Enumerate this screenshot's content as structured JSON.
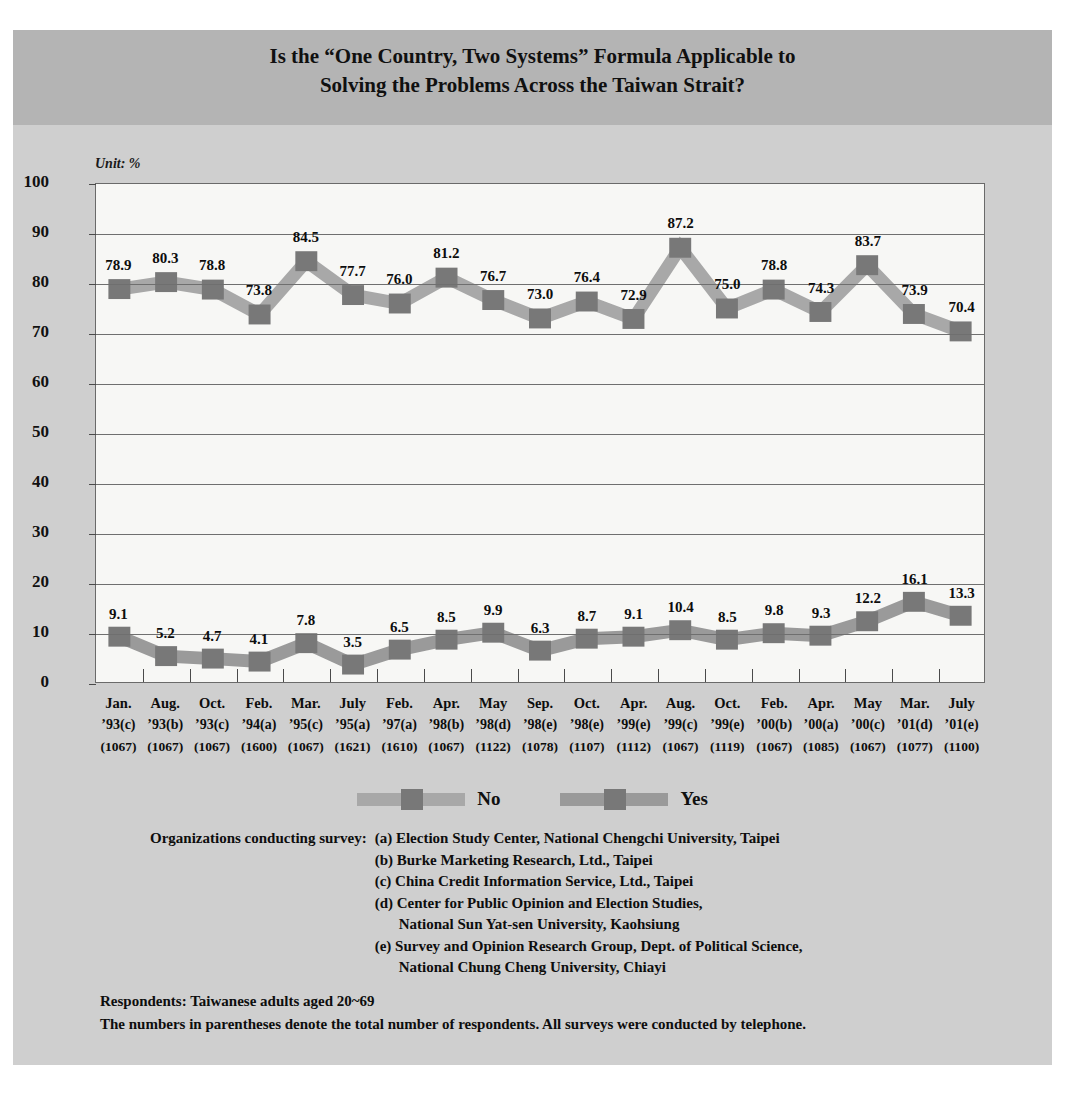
{
  "title": {
    "line1": "Is the “One Country, Two Systems” Formula Applicable to",
    "line2": "Solving the Problems Across the Taiwan Strait?"
  },
  "unit_label": "Unit: %",
  "legend": {
    "no_label": "No",
    "yes_label": "Yes",
    "no_color": "#a8a8a8",
    "yes_color": "#9a9a9a",
    "marker_color": "#787878"
  },
  "notes": {
    "org_heading": "Organizations conducting survey:",
    "orgs": [
      "(a) Election Study Center, National Chengchi University, Taipei",
      "(b) Burke Marketing Research, Ltd., Taipei",
      "(c) China Credit Information Service, Ltd., Taipei",
      "(d) Center for Public Opinion and Election Studies,",
      "National Sun Yat-sen University, Kaohsiung",
      "(e) Survey and Opinion Research Group, Dept. of Political Science,",
      "National Chung Cheng University, Chiayi"
    ],
    "respondents": "Respondents: Taiwanese adults aged 20~69",
    "parenthesis_note": "The numbers in parentheses denote the total number of respondents. All surveys were conducted by telephone."
  },
  "chart_data": {
    "type": "line",
    "title": "Is the “One Country, Two Systems” Formula Applicable to Solving the Problems Across the Taiwan Strait?",
    "xlabel": "",
    "ylabel": "",
    "unit": "%",
    "ylim": [
      0,
      100
    ],
    "yticks": [
      0,
      10,
      20,
      30,
      40,
      50,
      60,
      70,
      80,
      90,
      100
    ],
    "grid": true,
    "legend_position": "bottom",
    "categories": [
      {
        "month": "Jan.",
        "year": "’93(c)",
        "n": "(1067)"
      },
      {
        "month": "Aug.",
        "year": "’93(b)",
        "n": "(1067)"
      },
      {
        "month": "Oct.",
        "year": "’93(c)",
        "n": "(1067)"
      },
      {
        "month": "Feb.",
        "year": "’94(a)",
        "n": "(1600)"
      },
      {
        "month": "Mar.",
        "year": "’95(c)",
        "n": "(1067)"
      },
      {
        "month": "July",
        "year": "’95(a)",
        "n": "(1621)"
      },
      {
        "month": "Feb.",
        "year": "’97(a)",
        "n": "(1610)"
      },
      {
        "month": "Apr.",
        "year": "’98(b)",
        "n": "(1067)"
      },
      {
        "month": "May",
        "year": "’98(d)",
        "n": "(1122)"
      },
      {
        "month": "Sep.",
        "year": "’98(e)",
        "n": "(1078)"
      },
      {
        "month": "Oct.",
        "year": "’98(e)",
        "n": "(1107)"
      },
      {
        "month": "Apr.",
        "year": "’99(e)",
        "n": "(1112)"
      },
      {
        "month": "Aug.",
        "year": "’99(c)",
        "n": "(1067)"
      },
      {
        "month": "Oct.",
        "year": "’99(e)",
        "n": "(1119)"
      },
      {
        "month": "Feb.",
        "year": "’00(b)",
        "n": "(1067)"
      },
      {
        "month": "Apr.",
        "year": "’00(a)",
        "n": "(1085)"
      },
      {
        "month": "May",
        "year": "’00(c)",
        "n": "(1067)"
      },
      {
        "month": "Mar.",
        "year": "’01(d)",
        "n": "(1077)"
      },
      {
        "month": "July",
        "year": "’01(e)",
        "n": "(1100)"
      }
    ],
    "series": [
      {
        "name": "No",
        "color": "#a8a8a8",
        "values": [
          78.9,
          80.3,
          78.8,
          73.8,
          84.5,
          77.7,
          76.0,
          81.2,
          76.7,
          73.0,
          76.4,
          72.9,
          87.2,
          75.0,
          78.8,
          74.3,
          83.7,
          73.9,
          70.4
        ]
      },
      {
        "name": "Yes",
        "color": "#9a9a9a",
        "values": [
          9.1,
          5.2,
          4.7,
          4.1,
          7.8,
          3.5,
          6.5,
          8.5,
          9.9,
          6.3,
          8.7,
          9.1,
          10.4,
          8.5,
          9.8,
          9.3,
          12.2,
          16.1,
          13.3
        ]
      }
    ]
  }
}
